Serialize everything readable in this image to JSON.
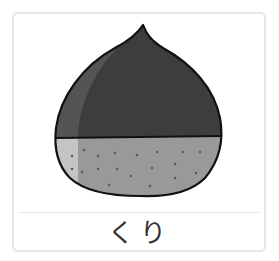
{
  "card": {
    "label": "くり",
    "illustration": "chestnut-icon"
  },
  "colors": {
    "shell_dark": "#3d3d3d",
    "shell_highlight": "#545454",
    "bottom": "#999999",
    "bottom_highlight": "#c4c4c4",
    "outline": "#111111",
    "border": "#e6e6e6"
  }
}
